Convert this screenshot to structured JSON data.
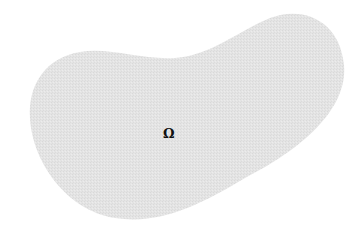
{
  "diagram": {
    "type": "domain-region",
    "shape": "kidney-shaped planar domain",
    "label": "Ω",
    "colors": {
      "fill": "#e3e3e3",
      "background": "#ffffff",
      "label": "#111111"
    }
  }
}
